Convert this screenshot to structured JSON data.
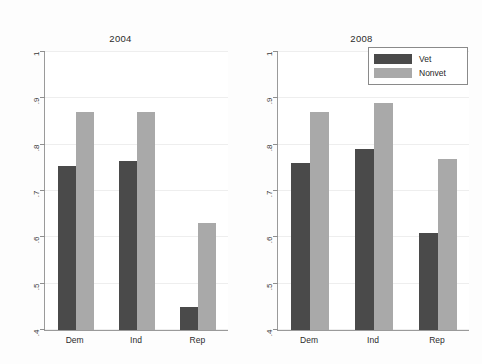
{
  "chart_data": {
    "type": "bar",
    "title": "",
    "subtitle": "",
    "xlabel": "",
    "ylabel": "",
    "ylim": [
      0.4,
      1.0
    ],
    "yticks": [
      0.4,
      0.5,
      0.6,
      0.7,
      0.8,
      0.9,
      1.0
    ],
    "ytick_labels": [
      "4",
      "5",
      "6",
      "7",
      "8",
      "9",
      "1"
    ],
    "ytick_labels_display": [
      ".4",
      ".5",
      ".6",
      ".7",
      ".8",
      ".9",
      "1"
    ],
    "grid": true,
    "grid_axis": "y",
    "legend_position": "top-right",
    "categories": [
      "Dem",
      "Ind",
      "Rep"
    ],
    "panels": [
      {
        "title": "2004",
        "series": [
          {
            "name": "Vet",
            "values": [
              0.755,
              0.765,
              0.45
            ]
          },
          {
            "name": "Nonvet",
            "values": [
              0.87,
              0.87,
              0.63
            ]
          }
        ]
      },
      {
        "title": "2008",
        "series": [
          {
            "name": "Vet",
            "values": [
              0.76,
              0.79,
              0.61
            ]
          },
          {
            "name": "Nonvet",
            "values": [
              0.87,
              0.89,
              0.77
            ]
          }
        ]
      }
    ],
    "colors": {
      "vet": "#4a4a4a",
      "nonvet": "#a9a9a9",
      "axis": "#9a9a9a",
      "grid": "#eeeeee",
      "background": "#fdfdfd",
      "plot_background": "#ffffff"
    }
  },
  "legend": {
    "items": [
      {
        "label": "Vet",
        "color": "#4a4a4a"
      },
      {
        "label": "Nonvet",
        "color": "#a9a9a9"
      }
    ]
  }
}
